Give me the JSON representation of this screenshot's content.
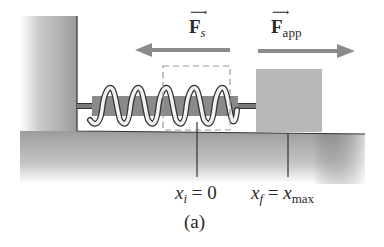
{
  "figure": {
    "panel_label": "(a)",
    "force_spring": {
      "symbol": "F",
      "subscript": "s",
      "vector_arrow": "⟶",
      "direction": "left"
    },
    "force_applied": {
      "symbol": "F",
      "subscript": "app",
      "vector_arrow": "⟶",
      "direction": "right"
    },
    "position_initial": {
      "var": "x",
      "sub": "i",
      "eq": " = 0"
    },
    "position_final": {
      "var": "x",
      "sub": "f",
      "eq": " = ",
      "rhs_var": "x",
      "rhs_sub": "max"
    },
    "colors": {
      "wall_floor": "#9a9a9a",
      "block": "#b8b8b8",
      "arrow": "#8a8a8a",
      "spring_dark": "#7a7a7a",
      "spring_light": "#f2f2f2",
      "outline": "#333333"
    }
  }
}
